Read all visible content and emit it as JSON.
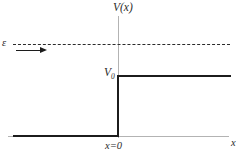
{
  "figure": {
    "title": ""
  },
  "labels": {
    "y_axis": "V(x)",
    "energy": "ε",
    "step_height": "V",
    "step_height_sub": "0",
    "origin": "x=0",
    "x_axis": "x"
  },
  "colors": {
    "curve": "#1c1c1c",
    "axis": "#b3b3b3",
    "dashed": "#2b2b2b",
    "background": "#ffffff"
  },
  "chart_data": {
    "type": "line",
    "title": "",
    "xlabel": "x",
    "ylabel": "V(x)",
    "grid": false,
    "legend": false,
    "xlim": [
      -1.0,
      1.05
    ],
    "ylim": [
      -0.12,
      1.25
    ],
    "annotations": [
      {
        "text": "V(x)",
        "role": "y-axis-label"
      },
      {
        "text": "ε",
        "role": "energy-level-label"
      },
      {
        "text": "V0",
        "role": "step-height-label"
      },
      {
        "text": "x=0",
        "role": "origin-label"
      },
      {
        "text": "x",
        "role": "x-axis-label"
      }
    ],
    "series": [
      {
        "name": "Potential V(x)",
        "style": "solid",
        "color": "#1c1c1c",
        "x": [
          -1.0,
          0.0,
          0.0,
          1.0
        ],
        "y": [
          0.0,
          0.0,
          0.55,
          0.55
        ]
      },
      {
        "name": "Incident energy ε",
        "style": "dashed",
        "color": "#2b2b2b",
        "x": [
          -1.0,
          1.0
        ],
        "y": [
          0.84,
          0.84
        ]
      }
    ],
    "markers": [
      {
        "name": "incident-particle-arrow",
        "type": "arrow",
        "direction": "right",
        "x_start": -0.97,
        "x_end": -0.68,
        "y": 0.79
      }
    ]
  }
}
